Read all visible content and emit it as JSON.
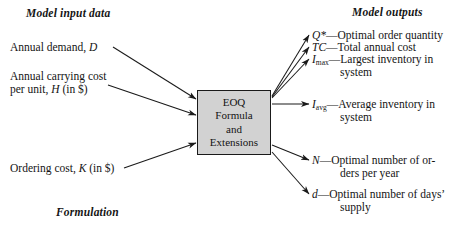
{
  "headings": {
    "input": "Model input data",
    "output": "Model outputs",
    "caption": "Formulation"
  },
  "center_box": {
    "lines": [
      "EOQ",
      "Formula",
      "and",
      "Extensions"
    ],
    "fill_color": "#d2d2d2",
    "border_color": "#1a1a1a"
  },
  "inputs": [
    {
      "text": "Annual demand, ",
      "symbol": "D",
      "symbol_sub": "",
      "tail": ""
    },
    {
      "text": "Annual carrying cost",
      "symbol": "",
      "symbol_sub": "",
      "tail": ""
    },
    {
      "text": "per unit, ",
      "symbol": "H",
      "symbol_sub": "",
      "tail": " (in $)"
    },
    {
      "text": "Ordering cost, ",
      "symbol": "K",
      "symbol_sub": "",
      "tail": " (in $)"
    }
  ],
  "outputs": [
    {
      "symbol": "Q*",
      "symbol_sub": "",
      "dash": "—",
      "desc": "Optimal order quantity",
      "cont": ""
    },
    {
      "symbol": "TC",
      "symbol_sub": "",
      "dash": "—",
      "desc": "Total annual cost",
      "cont": ""
    },
    {
      "symbol": "I",
      "symbol_sub": "max",
      "dash": "—",
      "desc": "Largest inventory in",
      "cont": "system"
    },
    {
      "symbol": "I",
      "symbol_sub": "avg",
      "dash": "—",
      "desc": "Average inventory in",
      "cont": "system"
    },
    {
      "symbol": "N",
      "symbol_sub": "",
      "dash": "—",
      "desc": "Optimal number of or-",
      "cont": "ders per year"
    },
    {
      "symbol": "d",
      "symbol_sub": "",
      "dash": "—",
      "desc": "Optimal number of days’",
      "cont": "supply"
    }
  ],
  "colors": {
    "ink": "#141414",
    "arrow": "#1a1a1a",
    "background": "#ffffff"
  }
}
